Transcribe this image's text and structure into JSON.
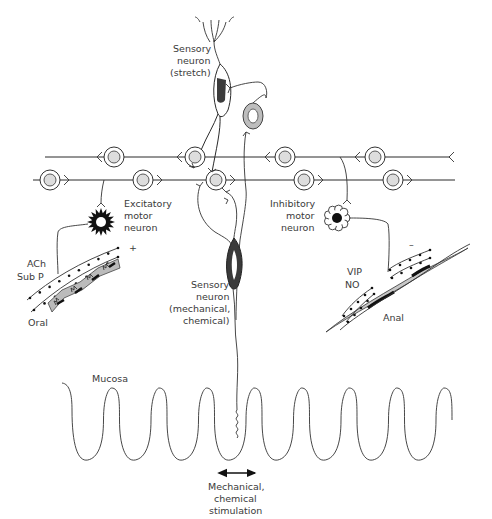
{
  "labels": {
    "sensory_stretch": [
      "Sensory",
      "neuron",
      "(stretch)"
    ],
    "excitatory_motor": [
      "Excitatory",
      "motor",
      "neuron"
    ],
    "inhibitory_motor": [
      "Inhibitory",
      "motor",
      "neuron"
    ],
    "sensory_mech": [
      "Sensory",
      "neuron",
      "(mechanical,",
      "chemical)"
    ],
    "ach_subp": [
      "ACh",
      "Sub P"
    ],
    "vip_no": [
      "VIP",
      "NO"
    ],
    "plus_sign": "+",
    "minus_sign": "–",
    "oral": "Oral",
    "anal": "Anal",
    "mucosa": "Mucosa",
    "stimulation": [
      "Mechanical,",
      "chemical",
      "stimulation"
    ]
  },
  "colors": {
    "line": "#2a2a2a",
    "ganglion_fill": "#d8d8d8",
    "smooth_muscle": "#b8b8b8",
    "nucleus_dark": "#222222",
    "text": "#3a3a3a"
  },
  "icons": {
    "stimulation_arrow": "double-headed-arrow",
    "excitatory_neuron": "spiky-star-cell",
    "inhibitory_neuron": "flower-cell"
  }
}
